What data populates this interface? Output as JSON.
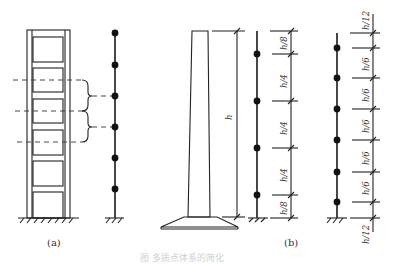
{
  "figure": {
    "caption_faint": "图  多质点体系的简化",
    "panel_a": {
      "label": "(a)",
      "frame_storeys": 6,
      "lumped_masses": 6,
      "description": "Multi-storey frame reduced to lumped-mass stick model; dashed mid-storey lines with braces indicate tributary mass"
    },
    "panel_b": {
      "label": "(b)",
      "height_label": "h",
      "stick_1": {
        "masses": 4,
        "segments": [
          "h/8",
          "h/4",
          "h/4",
          "h/4",
          "h/8"
        ]
      },
      "stick_2": {
        "masses": 6,
        "segments": [
          "h/12",
          "h/6",
          "h/6",
          "h/6",
          "h/6",
          "h/6",
          "h/12"
        ]
      }
    }
  },
  "colors": {
    "line": "#222222",
    "node": "#111111",
    "background": "#ffffff"
  }
}
